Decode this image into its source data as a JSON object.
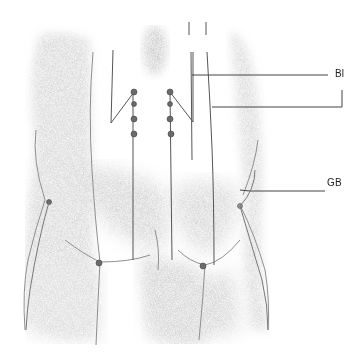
{
  "figure": {
    "view": "posterior lower torso and thighs",
    "labels": [
      {
        "id": "bl",
        "text": "Bl",
        "x": 335,
        "y": 73
      },
      {
        "id": "gb",
        "text": "GB",
        "x": 327,
        "y": 182
      }
    ],
    "colors": {
      "line": "#555555",
      "point": "#6a6a6a",
      "shade": "#9a9a9a"
    }
  }
}
